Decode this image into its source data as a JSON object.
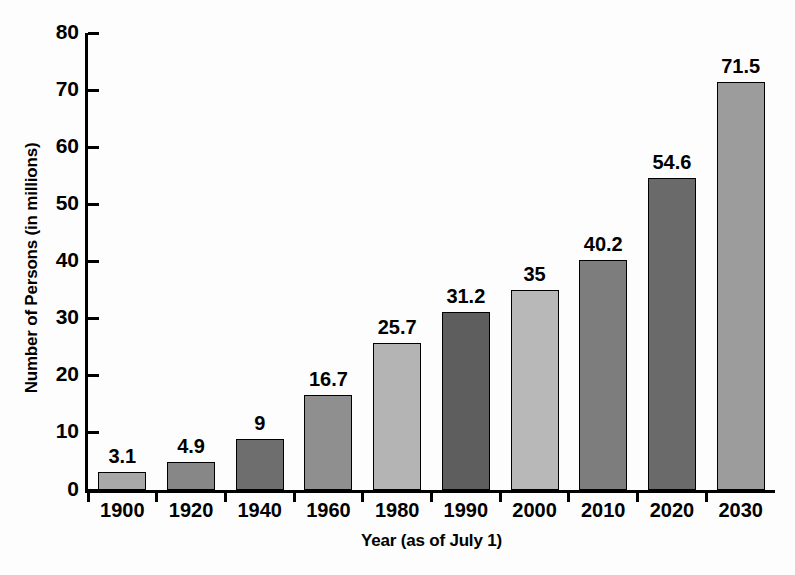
{
  "chart_data": {
    "type": "bar",
    "title": "",
    "xlabel": "Year (as of July 1)",
    "ylabel": "Number of Persons (in millions)",
    "categories": [
      "1900",
      "1920",
      "1940",
      "1960",
      "1980",
      "1990",
      "2000",
      "2010",
      "2020",
      "2030"
    ],
    "values": [
      3.1,
      4.9,
      9,
      16.7,
      25.7,
      31.2,
      35,
      40.2,
      54.6,
      71.5
    ],
    "value_labels": [
      "3.1",
      "4.9",
      "9",
      "16.7",
      "25.7",
      "31.2",
      "35",
      "40.2",
      "54.6",
      "71.5"
    ],
    "bar_colors": [
      "#a8a8a8",
      "#878787",
      "#6e6e6e",
      "#8f8f8f",
      "#b4b4b4",
      "#5e5e5e",
      "#b8b8b8",
      "#7d7d7d",
      "#6a6a6a",
      "#9c9c9c"
    ],
    "ylim": [
      0,
      80
    ],
    "ytick_step": 10,
    "ytick_labels": [
      "0",
      "10",
      "20",
      "30",
      "40",
      "50",
      "60",
      "70",
      "80"
    ],
    "grid": false,
    "legend": "none",
    "axis_color": "#000000",
    "background": "#fdfdfd"
  }
}
